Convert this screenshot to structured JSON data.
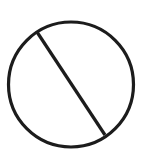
{
  "icon": {
    "name": "prohibited-icon",
    "label": "No / prohibited symbol",
    "stroke_color": "#1c1c1c",
    "background": "#ffffff",
    "circle": {
      "cx": 71,
      "cy": 84.5,
      "r": 62.5,
      "stroke_width": 3.2
    },
    "slash": {
      "x1": 37,
      "y1": 32,
      "x2": 105,
      "y2": 135,
      "stroke_width": 3.2
    }
  }
}
